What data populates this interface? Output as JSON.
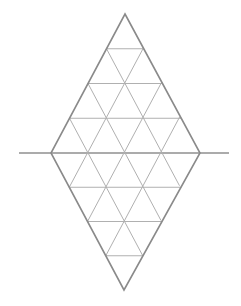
{
  "diagram": {
    "type": "triangular-grid-rhombus",
    "rows_per_half": 4,
    "vertices": {
      "top": [
        125,
        14
      ],
      "bottom": [
        124,
        290
      ],
      "left": [
        51,
        153
      ],
      "right": [
        200,
        153
      ]
    },
    "axis_line": {
      "x1": 19,
      "x2": 229,
      "y": 153
    },
    "colors": {
      "background": "#ffffff",
      "outline": "#8a8a8a",
      "grid": "#b0b0b0"
    }
  }
}
